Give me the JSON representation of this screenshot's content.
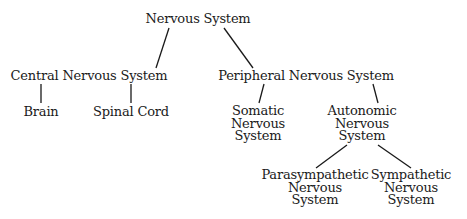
{
  "diagram": {
    "type": "tree",
    "nodes": {
      "root": {
        "lines": [
          "Nervous System"
        ]
      },
      "cns": {
        "lines": [
          "Central Nervous System"
        ]
      },
      "pns": {
        "lines": [
          "Peripheral Nervous System"
        ]
      },
      "brain": {
        "lines": [
          "Brain"
        ]
      },
      "spinal": {
        "lines": [
          "Spinal Cord"
        ]
      },
      "somatic": {
        "lines": [
          "Somatic",
          "Nervous",
          "System"
        ]
      },
      "autonomic": {
        "lines": [
          "Autonomic",
          "Nervous",
          "System"
        ]
      },
      "para": {
        "lines": [
          "Parasympathetic",
          "Nervous",
          "System"
        ]
      },
      "symp": {
        "lines": [
          "Sympathetic",
          "Nervous",
          "System"
        ]
      }
    },
    "edges": [
      [
        "root",
        "cns"
      ],
      [
        "root",
        "pns"
      ],
      [
        "cns",
        "brain"
      ],
      [
        "cns",
        "spinal"
      ],
      [
        "pns",
        "somatic"
      ],
      [
        "pns",
        "autonomic"
      ],
      [
        "autonomic",
        "para"
      ],
      [
        "autonomic",
        "symp"
      ]
    ],
    "colors": {
      "text": "#1a1a1a",
      "line": "#1a1a1a",
      "background": "#ffffff"
    }
  }
}
